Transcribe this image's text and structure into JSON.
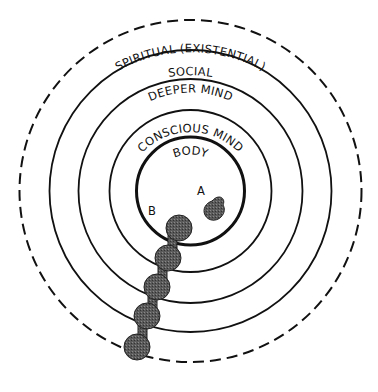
{
  "diagram": {
    "center": [
      190.5,
      191
    ],
    "rings": [
      {
        "id": "spiritual",
        "label": "SPIRITUAL  (EXISTENTIAL)",
        "radius": 171,
        "dashed": true
      },
      {
        "id": "social",
        "label": "SOCIAL",
        "radius": 141,
        "dashed": false
      },
      {
        "id": "deeper-mind",
        "label": "DEEPER MIND",
        "radius": 112,
        "dashed": false
      },
      {
        "id": "conscious-mind",
        "label": "CONSCIOUS MIND",
        "radius": 81,
        "dashed": false
      },
      {
        "id": "body",
        "label": "BODY",
        "radius": 54,
        "dashed": false
      }
    ],
    "markers": {
      "a": "A",
      "b": "B"
    },
    "colors": {
      "stroke": "#111111",
      "fill_shaded": "#555555"
    }
  }
}
